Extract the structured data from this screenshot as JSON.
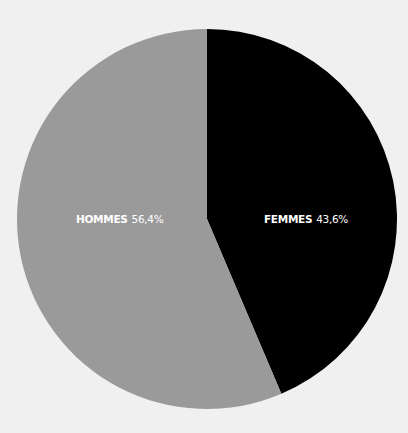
{
  "chart_data": {
    "type": "pie",
    "title": "",
    "categories": [
      "FEMMES",
      "HOMMES"
    ],
    "values": [
      43.6,
      56.4
    ],
    "value_labels": [
      "43,6%",
      "56,4%"
    ],
    "colors": [
      "#000000",
      "#9a9a9a"
    ],
    "start_angle": "12 o'clock",
    "direction": "clockwise",
    "legend": "none (inline labels)"
  },
  "labels": {
    "femmes": {
      "name": "FEMMES",
      "value": "43,6%"
    },
    "hommes": {
      "name": "HOMMES",
      "value": "56,4%"
    }
  },
  "background": "#f0f0f0"
}
